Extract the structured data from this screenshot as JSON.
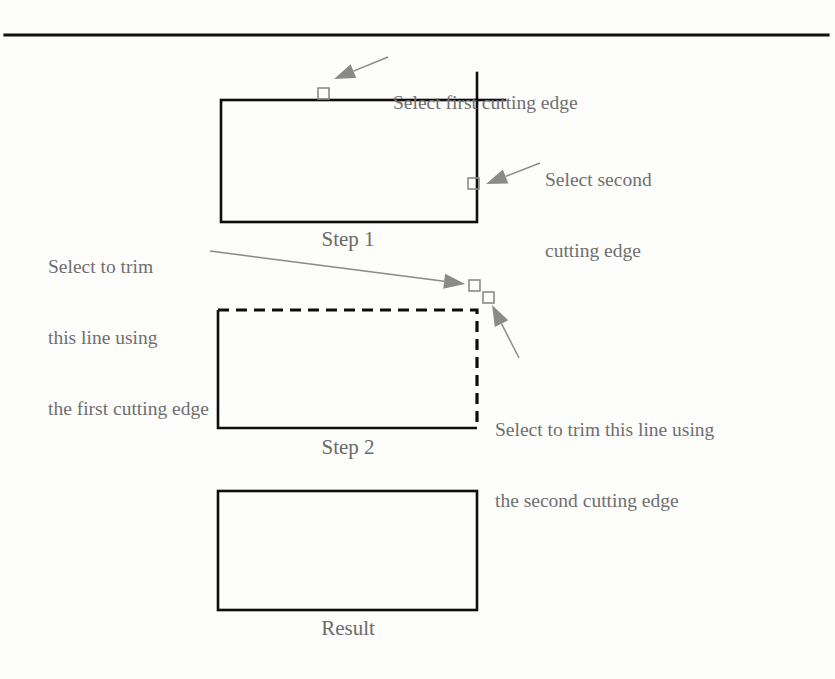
{
  "figure": {
    "type": "instructional-diagram",
    "background_color": "#fdfdfc",
    "line_color": "#000000",
    "annotation_color": "#6f6f6f",
    "handle_color": "#8a8a8a"
  },
  "rule": {
    "name": "top-horizontal-rule",
    "x1": 5,
    "y1": 35,
    "x2": 828,
    "y2": 35,
    "width": 3.2,
    "color": "#111111"
  },
  "steps": [
    {
      "id": "step1",
      "caption": "Step 1",
      "caption_x": 348,
      "caption_y": 248,
      "rect": {
        "x": 221,
        "y": 100,
        "w": 256,
        "h": 122
      },
      "edges": {
        "top": "solid",
        "right": "solid",
        "bottom": "solid",
        "left": "solid"
      },
      "overshoot": [
        {
          "name": "top-edge-extension",
          "x1": 477,
          "y1": 100,
          "x2": 505,
          "y2": 100
        },
        {
          "name": "right-edge-extension",
          "x1": 477,
          "y1": 100,
          "x2": 477,
          "y2": 73
        }
      ]
    },
    {
      "id": "step2",
      "caption": "Step 2",
      "caption_x": 348,
      "caption_y": 456,
      "rect": {
        "x": 218,
        "y": 310,
        "w": 259,
        "h": 118
      },
      "edges": {
        "top": "dashed",
        "right": "dashed",
        "bottom": "solid",
        "left": "solid"
      },
      "overshoot": []
    },
    {
      "id": "result",
      "caption": "Result",
      "caption_x": 348,
      "caption_y": 637,
      "rect": {
        "x": 218,
        "y": 491,
        "w": 259,
        "h": 119
      },
      "edges": {
        "top": "solid",
        "right": "solid",
        "bottom": "solid",
        "left": "solid"
      },
      "overshoot": []
    }
  ],
  "handles": [
    {
      "name": "pick-handle-first-cutting-edge",
      "x": 318,
      "y": 88,
      "size": 11
    },
    {
      "name": "pick-handle-second-cutting-edge",
      "x": 468,
      "y": 178,
      "size": 11
    },
    {
      "name": "pick-handle-trim-first",
      "x": 469,
      "y": 280,
      "size": 11
    },
    {
      "name": "pick-handle-trim-second",
      "x": 483,
      "y": 292,
      "size": 11
    }
  ],
  "callouts": [
    {
      "id": "callout-first-cutting-edge",
      "lines": [
        "Select first cutting edge"
      ],
      "x": 393,
      "y": 43,
      "align": "left",
      "leader": {
        "x1": 388,
        "y1": 57,
        "x2": 334,
        "y2": 79
      }
    },
    {
      "id": "callout-second-cutting-edge",
      "lines": [
        "Select second",
        "cutting edge"
      ],
      "x": 545,
      "y": 120,
      "align": "left",
      "leader": {
        "x1": 540,
        "y1": 163,
        "x2": 486,
        "y2": 184
      }
    },
    {
      "id": "callout-trim-first",
      "lines": [
        "Select to trim",
        "this line using",
        "the first cutting edge"
      ],
      "x": 48,
      "y": 207,
      "align": "left",
      "leader": {
        "x1": 210,
        "y1": 251,
        "x2": 465,
        "y2": 284
      }
    },
    {
      "id": "callout-trim-second",
      "lines": [
        "Select to trim this line using",
        "the second cutting edge"
      ],
      "x": 495,
      "y": 370,
      "align": "left",
      "leader": {
        "x1": 519,
        "y1": 358,
        "x2": 492,
        "y2": 305
      }
    }
  ]
}
